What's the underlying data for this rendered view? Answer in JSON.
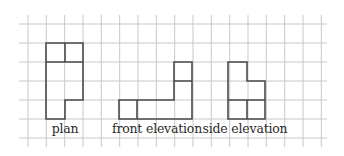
{
  "diagram": {
    "type": "orthographic-projection",
    "grid": {
      "cell_size": 18.33,
      "x_lines": [
        28,
        46.3,
        64.7,
        83,
        101.3,
        119.7,
        138,
        156.3,
        174.7,
        193,
        211.3,
        229.7,
        248,
        266.3,
        284.7,
        303,
        321.3
      ],
      "y_lines": [
        24,
        43,
        62,
        81,
        100,
        119,
        138
      ],
      "x_extent": [
        19,
        327
      ],
      "y_extent": [
        15,
        147
      ],
      "color": "#c8c8c8"
    },
    "outline_color": "#4a4a4a",
    "views": [
      {
        "name": "plan",
        "label": "plan",
        "label_x": 65,
        "outline": "M46,43 L83,43 L83,100 L65,100 L65,119 L46,119 Z",
        "inner": "M46,62 L83,62 M65,43 L65,62"
      },
      {
        "name": "front-elevation",
        "label": "front elevation",
        "label_x": 157,
        "outline": "M119,100 L174,100 L174,62 L192,62 L192,119 L119,119 Z",
        "inner": "M137,100 L137,119 M174,81 L192,81"
      },
      {
        "name": "side-elevation",
        "label": "side elevation",
        "label_x": 245,
        "outline": "M228,62 L247,62 L247,81 L265,81 L265,119 L228,119 Z",
        "inner": "M228,100 L265,100 M247,100 L247,119"
      }
    ]
  }
}
